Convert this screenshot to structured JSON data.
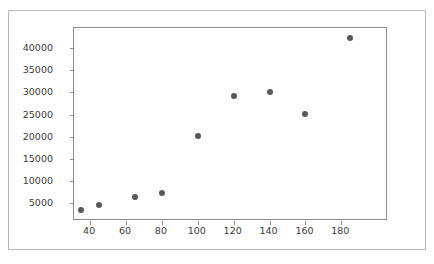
{
  "figure": {
    "top_artifact_text": "",
    "background_color": "#ffffff",
    "outer_border_color": "#b9b9bd",
    "axes_border_color": "#8e8e93",
    "marker_color": "#595959",
    "tick_label_color": "#3b3b3b"
  },
  "chart_data": {
    "type": "scatter",
    "title": "",
    "subtitle": "",
    "xlabel": "",
    "ylabel": "",
    "grid": false,
    "legend": null,
    "legend_position": "none",
    "marker": "circle",
    "marker_color": "#595959",
    "xlim": [
      31,
      206
    ],
    "ylim": [
      1000,
      44500
    ],
    "xticks": [
      40,
      60,
      80,
      100,
      120,
      140,
      160,
      180
    ],
    "xtick_labels": [
      "40",
      "60",
      "80",
      "100",
      "120",
      "140",
      "160",
      "180"
    ],
    "yticks": [
      5000,
      10000,
      15000,
      20000,
      25000,
      30000,
      35000,
      40000
    ],
    "ytick_labels": [
      "5000",
      "10000",
      "15000",
      "20000",
      "25000",
      "30000",
      "35000",
      "40000"
    ],
    "x": [
      35,
      45,
      65,
      80,
      100,
      120,
      140,
      160,
      185
    ],
    "y": [
      3500,
      4700,
      6400,
      7400,
      20100,
      29100,
      30100,
      25100,
      42300
    ],
    "points": [
      {
        "x": 35,
        "y": 3500
      },
      {
        "x": 45,
        "y": 4700
      },
      {
        "x": 65,
        "y": 6400
      },
      {
        "x": 80,
        "y": 7400
      },
      {
        "x": 100,
        "y": 20100
      },
      {
        "x": 120,
        "y": 29100
      },
      {
        "x": 140,
        "y": 30100
      },
      {
        "x": 160,
        "y": 25100
      },
      {
        "x": 185,
        "y": 42300
      }
    ]
  }
}
